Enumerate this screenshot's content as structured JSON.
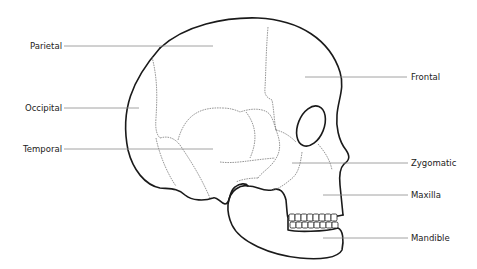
{
  "diagram": {
    "labels": {
      "parietal": "Parietal",
      "occipital": "Occipital",
      "temporal": "Temporal",
      "frontal": "Frontal",
      "zygomatic": "Zygomatic",
      "maxilla": "Maxilla",
      "mandible": "Mandible"
    },
    "colors": {
      "background": "#ffffff",
      "outline": "#1a1a1a",
      "suture": "#6a6a6a",
      "leader_line": "#8a8a8a",
      "text": "#222222"
    }
  }
}
